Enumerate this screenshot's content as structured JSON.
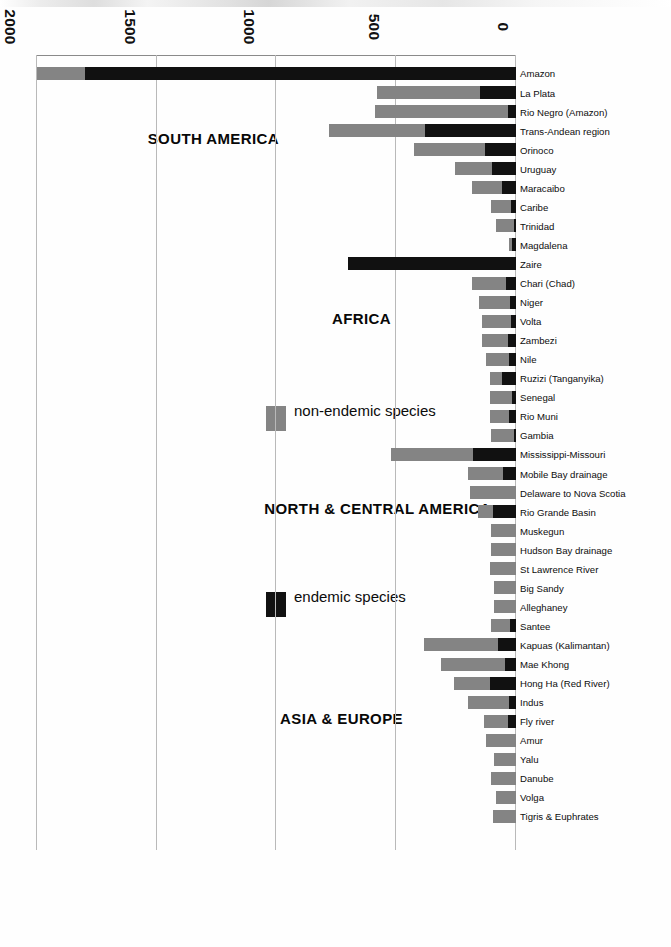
{
  "figure": {
    "orientation_note": "rotated-180",
    "colors": {
      "endemic": "#111111",
      "non_endemic": "#848484",
      "gridline": "#b9b9b9",
      "axis": "#8a8a8a",
      "background": "#ffffff"
    }
  },
  "legend": {
    "position": "middle-left",
    "items": [
      {
        "label": "endemic species",
        "color": "#111111",
        "swatch": "legend-swatch-endemic"
      },
      {
        "label": "non-endemic species",
        "color": "#848484",
        "swatch": "legend-swatch-non-endemic"
      }
    ]
  },
  "groups": [
    {
      "id": "south-america",
      "label": "SOUTH AMERICA"
    },
    {
      "id": "africa",
      "label": "AFRICA"
    },
    {
      "id": "north-central-america",
      "label": "NORTH & CENTRAL AMERICA"
    },
    {
      "id": "asia-europe",
      "label": "ASIA & EUROPE"
    }
  ],
  "chart_data": {
    "type": "bar",
    "orientation": "horizontal-stacked",
    "title": "",
    "subtitle": "",
    "xlabel": "",
    "ylabel": "",
    "xlim": [
      0,
      2000
    ],
    "xticks": [
      0,
      500,
      1000,
      1500,
      2000
    ],
    "xtick_labels": [
      "0",
      "500",
      "1000",
      "1500",
      "2000"
    ],
    "grid": true,
    "legend_position": "middle-left",
    "series": [
      {
        "name": "endemic species",
        "color": "#111111"
      },
      {
        "name": "non-endemic species",
        "color": "#848484"
      }
    ],
    "categories": [
      "Amazon",
      "La Plata",
      "Rio Negro (Amazon)",
      "Trans-Andean region",
      "Orinoco",
      "Uruguay",
      "Maracaibo",
      "Caribe",
      "Trinidad",
      "Magdalena",
      "Zaire",
      "Chari (Chad)",
      "Niger",
      "Volta",
      "Zambezi",
      "Nile",
      "Ruzizi (Tanganyika)",
      "Senegal",
      "Rio Muni",
      "Gambia",
      "Mississippi-Missouri",
      "Mobile Bay drainage",
      "Delaware to Nova Scotia",
      "Rio Grande Basin",
      "Muskegun",
      "Hudson Bay drainage",
      "St Lawrence River",
      "Big Sandy",
      "Alleghaney",
      "Santee",
      "Kapuas (Kalimantan)",
      "Mae Khong",
      "Hong Ha (Red River)",
      "Indus",
      "Fly river",
      "Amur",
      "Yalu",
      "Danube",
      "Volga",
      "Tigris & Euphrates"
    ],
    "group_of_category": [
      "SOUTH AMERICA",
      "SOUTH AMERICA",
      "SOUTH AMERICA",
      "SOUTH AMERICA",
      "SOUTH AMERICA",
      "SOUTH AMERICA",
      "SOUTH AMERICA",
      "SOUTH AMERICA",
      "SOUTH AMERICA",
      "SOUTH AMERICA",
      "AFRICA",
      "AFRICA",
      "AFRICA",
      "AFRICA",
      "AFRICA",
      "AFRICA",
      "AFRICA",
      "AFRICA",
      "AFRICA",
      "AFRICA",
      "NORTH & CENTRAL AMERICA",
      "NORTH & CENTRAL AMERICA",
      "NORTH & CENTRAL AMERICA",
      "NORTH & CENTRAL AMERICA",
      "NORTH & CENTRAL AMERICA",
      "NORTH & CENTRAL AMERICA",
      "NORTH & CENTRAL AMERICA",
      "NORTH & CENTRAL AMERICA",
      "NORTH & CENTRAL AMERICA",
      "NORTH & CENTRAL AMERICA",
      "ASIA & EUROPE",
      "ASIA & EUROPE",
      "ASIA & EUROPE",
      "ASIA & EUROPE",
      "ASIA & EUROPE",
      "ASIA & EUROPE",
      "ASIA & EUROPE",
      "ASIA & EUROPE",
      "ASIA & EUROPE",
      "ASIA & EUROPE"
    ],
    "endemic": [
      1800,
      150,
      35,
      380,
      130,
      100,
      60,
      20,
      10,
      15,
      700,
      40,
      25,
      20,
      35,
      30,
      60,
      15,
      30,
      10,
      180,
      55,
      0,
      95,
      0,
      0,
      0,
      0,
      0,
      25,
      75,
      45,
      110,
      30,
      35,
      0,
      0,
      0,
      0,
      0
    ],
    "non_endemic": [
      200,
      430,
      555,
      400,
      295,
      155,
      125,
      85,
      75,
      15,
      0,
      145,
      130,
      120,
      105,
      95,
      50,
      95,
      80,
      95,
      340,
      145,
      190,
      65,
      105,
      105,
      110,
      90,
      90,
      80,
      310,
      270,
      150,
      170,
      100,
      125,
      90,
      105,
      85,
      95
    ],
    "totals": [
      2000,
      580,
      590,
      780,
      425,
      255,
      185,
      105,
      85,
      30,
      700,
      185,
      155,
      140,
      140,
      125,
      110,
      110,
      110,
      105,
      520,
      200,
      190,
      160,
      105,
      105,
      110,
      90,
      90,
      105,
      385,
      315,
      260,
      200,
      135,
      125,
      90,
      105,
      85,
      95
    ]
  }
}
